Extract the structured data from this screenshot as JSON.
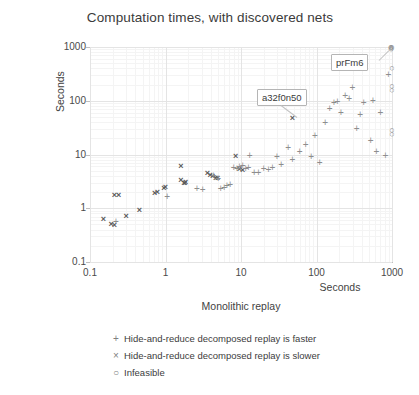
{
  "chart_data": {
    "type": "scatter",
    "title": "Computation times, with discovered nets",
    "xlabel": "Monolithic replay",
    "xunit": "Seconds",
    "ylabel": "Hide-and-reduce decomposed replay",
    "yunit": "Seconds",
    "xscale": "log",
    "yscale": "log",
    "xlim": [
      0.1,
      1000
    ],
    "ylim": [
      0.1,
      1000
    ],
    "xticks": [
      "0.1",
      "1",
      "10",
      "100",
      "1000"
    ],
    "yticks": [
      "1000",
      "100",
      "10",
      "1",
      "0.1"
    ],
    "grid": true,
    "legend_position": "below-plot",
    "legend": [
      {
        "marker": "+",
        "label": "Hide-and-reduce decomposed replay is faster"
      },
      {
        "marker": "×",
        "label": "Hide-and-reduce decomposed replay is slower"
      },
      {
        "marker": "○",
        "label": "Infeasible"
      }
    ],
    "annotations": [
      {
        "text": "prFm6",
        "x": 400,
        "y": 950
      },
      {
        "text": "a32f0n50",
        "x": 30,
        "y": 150
      }
    ],
    "series": [
      {
        "name": "Hide-and-reduce decomposed replay is slower",
        "marker": "×",
        "points": [
          [
            0.15,
            0.62
          ],
          [
            0.19,
            0.52
          ],
          [
            0.21,
            0.48
          ],
          [
            0.21,
            1.75
          ],
          [
            0.24,
            1.8
          ],
          [
            0.3,
            0.72
          ],
          [
            0.45,
            0.92
          ],
          [
            0.72,
            1.9
          ],
          [
            0.78,
            2.0
          ],
          [
            0.95,
            2.4
          ],
          [
            1.0,
            2.5
          ],
          [
            1.6,
            3.3
          ],
          [
            1.75,
            3.0
          ],
          [
            1.8,
            2.9
          ],
          [
            1.85,
            3.1
          ],
          [
            1.6,
            6.2
          ],
          [
            3.6,
            4.5
          ],
          [
            3.9,
            4.2
          ],
          [
            4.2,
            4.0
          ],
          [
            4.6,
            3.7
          ],
          [
            4.9,
            3.6
          ],
          [
            8.5,
            9.5
          ],
          [
            9.5,
            5.4
          ],
          [
            10.5,
            5.2
          ],
          [
            48,
            48
          ]
        ]
      },
      {
        "name": "Hide-and-reduce decomposed replay is faster",
        "marker": "+",
        "points": [
          [
            0.22,
            0.55
          ],
          [
            1.05,
            1.6
          ],
          [
            2.6,
            2.3
          ],
          [
            3.1,
            2.2
          ],
          [
            4.3,
            3.9
          ],
          [
            5.0,
            3.5
          ],
          [
            5.4,
            2.3
          ],
          [
            6.0,
            2.4
          ],
          [
            6.5,
            2.6
          ],
          [
            7.2,
            2.7
          ],
          [
            8.0,
            5.6
          ],
          [
            8.8,
            5.4
          ],
          [
            9.5,
            5.8
          ],
          [
            10.5,
            6.0
          ],
          [
            11.5,
            5.3
          ],
          [
            12.5,
            5.6
          ],
          [
            13,
            9.5
          ],
          [
            15,
            4.6
          ],
          [
            17,
            4.5
          ],
          [
            20,
            5.4
          ],
          [
            23,
            5.2
          ],
          [
            26,
            5.5
          ],
          [
            30,
            9.0
          ],
          [
            34,
            6.5
          ],
          [
            42,
            13
          ],
          [
            48,
            8.0
          ],
          [
            60,
            11
          ],
          [
            72,
            15
          ],
          [
            85,
            9.0
          ],
          [
            95,
            22
          ],
          [
            110,
            7.0
          ],
          [
            130,
            38
          ],
          [
            150,
            70
          ],
          [
            170,
            90
          ],
          [
            190,
            95
          ],
          [
            210,
            60
          ],
          [
            240,
            120
          ],
          [
            270,
            110
          ],
          [
            300,
            175
          ],
          [
            340,
            30
          ],
          [
            380,
            55
          ],
          [
            420,
            90
          ],
          [
            520,
            18
          ],
          [
            560,
            100
          ],
          [
            620,
            11
          ],
          [
            700,
            60
          ],
          [
            820,
            9.5
          ],
          [
            900,
            300
          ]
        ]
      },
      {
        "name": "Infeasible",
        "marker": "○",
        "points": [
          [
            960,
            1000
          ],
          [
            980,
            1000
          ],
          [
            1000,
            1000
          ],
          [
            960,
            960
          ],
          [
            1000,
            960
          ],
          [
            980,
            920
          ],
          [
            1000,
            400
          ],
          [
            1000,
            190
          ],
          [
            1000,
            160
          ],
          [
            1000,
            28
          ],
          [
            1000,
            24
          ]
        ]
      }
    ]
  }
}
